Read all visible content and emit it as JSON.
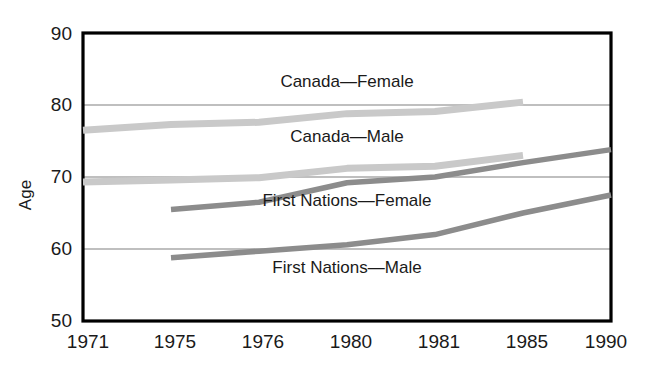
{
  "chart_data": {
    "type": "line",
    "title": "",
    "xlabel": "",
    "ylabel": "Age",
    "ylim": [
      50,
      90
    ],
    "yticks": [
      50,
      60,
      70,
      80,
      90
    ],
    "categories": [
      "1971",
      "1975",
      "1976",
      "1980",
      "1981",
      "1985",
      "1990"
    ],
    "grid": "horizontal",
    "legend_position": "inline-annotations",
    "series": [
      {
        "name": "Canada—Female",
        "color": "#c9c9c9",
        "x": [
          "1971",
          "1975",
          "1976",
          "1980",
          "1981",
          "1985"
        ],
        "values": [
          76.5,
          77.3,
          77.6,
          78.8,
          79.1,
          80.4
        ],
        "label_x": "1980",
        "label_y": 82.5
      },
      {
        "name": "Canada—Male",
        "color": "#c9c9c9",
        "x": [
          "1971",
          "1975",
          "1976",
          "1980",
          "1981",
          "1985"
        ],
        "values": [
          69.3,
          69.6,
          69.9,
          71.2,
          71.5,
          73.0
        ],
        "label_x": "1980",
        "label_y": 74.9
      },
      {
        "name": "First Nations—Female",
        "color": "#8c8c8c",
        "x": [
          "1975",
          "1976",
          "1980",
          "1981",
          "1985",
          "1990"
        ],
        "values": [
          65.5,
          66.5,
          69.2,
          70.0,
          72.0,
          73.8
        ],
        "label_x": "1980",
        "label_y": 66.0
      },
      {
        "name": "First Nations—Male",
        "color": "#8c8c8c",
        "x": [
          "1975",
          "1976",
          "1980",
          "1981",
          "1985",
          "1990"
        ],
        "values": [
          58.8,
          59.7,
          60.6,
          62.0,
          65.0,
          67.5
        ],
        "label_x": "1980",
        "label_y": 56.6
      }
    ]
  },
  "axes": {
    "y_label": "Age",
    "y_ticks": [
      "90",
      "80",
      "70",
      "60",
      "50"
    ],
    "x_ticks": [
      "1971",
      "1975",
      "1976",
      "1980",
      "1981",
      "1985",
      "1990"
    ]
  },
  "annotations": [
    "Canada—Female",
    "Canada—Male",
    "First Nations—Female",
    "First Nations—Male"
  ],
  "colors": {
    "canada_series": "#c9c9c9",
    "first_nations_series": "#8c8c8c",
    "frame": "#000000",
    "gridline": "#808080",
    "text": "#1a1a1a",
    "background": "#ffffff"
  }
}
